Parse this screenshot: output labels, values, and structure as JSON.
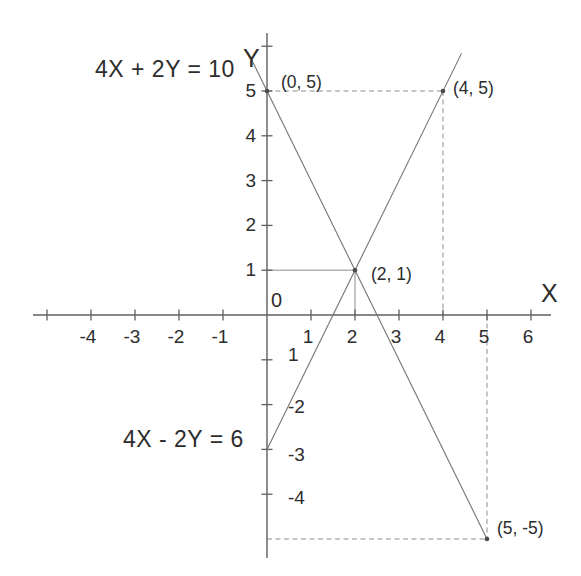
{
  "figure": {
    "background": "#ffffff",
    "ink_color": "#2d2d2d",
    "axis_color": "#5f5f5f",
    "line_color": "#747474",
    "construction_color": "#8d8d8d",
    "point_color": "#4a4a4a"
  },
  "chart_data": {
    "type": "line",
    "title": "",
    "xlabel": "X",
    "ylabel": "Y",
    "origin_label": "0",
    "xlim": [
      -5.3,
      6.45
    ],
    "ylim": [
      -5.45,
      6.25
    ],
    "grid": false,
    "legend": "none",
    "equation_labels": [
      {
        "text": "4X + 2Y = 10",
        "px": 95,
        "py": 77
      },
      {
        "text": "4X - 2Y = 6",
        "px": 123,
        "py": 447
      }
    ],
    "series": [
      {
        "name": "4X + 2Y = 10",
        "x": [
          -0.43,
          5
        ],
        "y": [
          5.86,
          -5
        ]
      },
      {
        "name": "4X - 2Y = 6",
        "x": [
          0,
          4.42
        ],
        "y": [
          -3,
          5.84
        ]
      }
    ],
    "points": [
      {
        "label": "(0, 5)",
        "x": 0,
        "y": 5,
        "label_dx": 14,
        "label_dy": -3
      },
      {
        "label": "(4, 5)",
        "x": 4,
        "y": 5,
        "label_dx": 10,
        "label_dy": 3
      },
      {
        "label": "(2, 1)",
        "x": 2,
        "y": 1,
        "label_dx": 16,
        "label_dy": 10
      },
      {
        "label": "(5, -5)",
        "x": 5,
        "y": -5,
        "label_dx": 10,
        "label_dy": -5
      }
    ],
    "construction_segments": [
      {
        "from": [
          0,
          5
        ],
        "to": [
          4,
          5
        ],
        "style": "dashed"
      },
      {
        "from": [
          4,
          5
        ],
        "to": [
          4,
          0
        ],
        "style": "dashed"
      },
      {
        "from": [
          0,
          1
        ],
        "to": [
          2,
          1
        ],
        "style": "solid"
      },
      {
        "from": [
          2,
          1
        ],
        "to": [
          2,
          0
        ],
        "style": "solid"
      },
      {
        "from": [
          5,
          0
        ],
        "to": [
          5,
          -5
        ],
        "style": "dashed"
      },
      {
        "from": [
          0,
          -5
        ],
        "to": [
          5,
          -5
        ],
        "style": "dashed"
      }
    ],
    "x_ticks": [
      -5,
      -4,
      -3,
      -2,
      -1,
      1,
      2,
      3,
      4,
      5,
      6
    ],
    "x_tick_labels": [
      {
        "text": "-4",
        "x": -4
      },
      {
        "text": "-3",
        "x": -3
      },
      {
        "text": "-2",
        "x": -2
      },
      {
        "text": "-1",
        "x": -1
      },
      {
        "text": "1",
        "x": 1
      },
      {
        "text": "2",
        "x": 2
      },
      {
        "text": "3",
        "x": 3
      },
      {
        "text": "4",
        "x": 4
      },
      {
        "text": "5",
        "x": 5
      },
      {
        "text": "6",
        "x": 6
      }
    ],
    "y_ticks": [
      6,
      5,
      4,
      3,
      2,
      1,
      -1,
      -2,
      -3,
      -4
    ],
    "y_tick_labels_left": [
      {
        "text": "5",
        "y": 5
      },
      {
        "text": "4",
        "y": 4
      },
      {
        "text": "3",
        "y": 3
      },
      {
        "text": "2",
        "y": 2
      },
      {
        "text": "1",
        "y": 1
      }
    ],
    "y_tick_labels_right": [
      {
        "text": "1",
        "y": -1,
        "dy": 1
      },
      {
        "text": "-2",
        "y": -2,
        "dy": 8
      },
      {
        "text": "-3",
        "y": -3,
        "dy": 12
      },
      {
        "text": "-4",
        "y": -4,
        "dy": 10
      }
    ]
  }
}
